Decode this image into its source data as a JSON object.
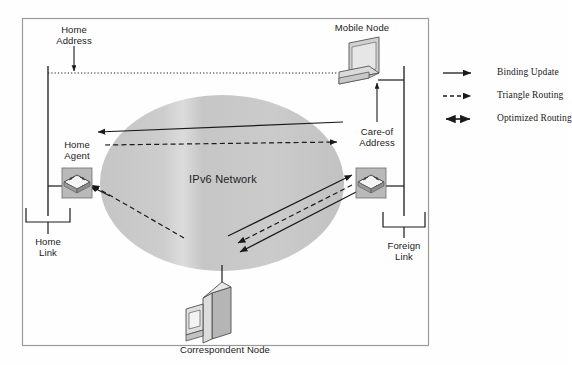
{
  "figure": {
    "network_label": "IPv6 Network",
    "frame_color": "#8a8a8a",
    "cloud_color": "#c9c9c9",
    "line_color": "#1a1a1a"
  },
  "nodes": {
    "mobile_node": "Mobile Node",
    "home_agent": "Home\nAgent",
    "correspondent_node": "Correspondent Node"
  },
  "annotations": {
    "home_address": "Home\nAddress",
    "care_of_address": "Care-of\nAddress",
    "home_link": "Home\nLink",
    "foreign_link": "Foreign\nLink"
  },
  "legend": {
    "items": [
      {
        "label": "Binding Update",
        "style": "solid-arrow",
        "icon": "arrow-right-icon"
      },
      {
        "label": "Triangle Routing",
        "style": "dashed-arrow",
        "icon": "dashed-arrow-right-icon"
      },
      {
        "label": "Optimized Routing",
        "style": "double-arrow",
        "icon": "arrow-both-icon"
      }
    ]
  }
}
